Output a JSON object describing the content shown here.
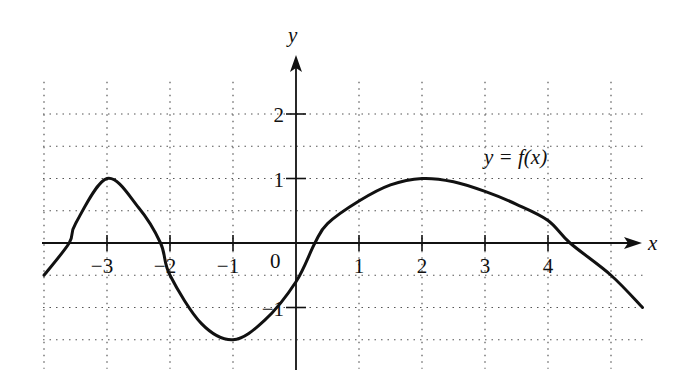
{
  "chart_data": {
    "type": "line",
    "title": "",
    "curve_label": "y = f(x)",
    "xlabel": "x",
    "ylabel": "y",
    "origin_label": "0",
    "xlim": [
      -4,
      5.5
    ],
    "ylim": [
      -2,
      3
    ],
    "grid": true,
    "grid_x_step": 1,
    "grid_y_step": 0.5,
    "x_ticks": [
      -3,
      -2,
      -1,
      1,
      2,
      3,
      4
    ],
    "x_tick_labels": [
      "−3",
      "−2",
      "−1",
      "1",
      "2",
      "3",
      "4"
    ],
    "y_ticks": [
      2,
      1,
      -1
    ],
    "y_tick_labels": [
      "2",
      "1",
      "−1"
    ],
    "series": [
      {
        "name": "f(x)",
        "x": [
          -4,
          -3.6,
          -3.5,
          -3,
          -2.5,
          -2.15,
          -2,
          -1.5,
          -1,
          -0.5,
          0,
          0.3,
          0.5,
          1,
          1.5,
          2,
          2.5,
          3,
          3.5,
          4,
          4.35,
          5,
          5.5
        ],
        "y": [
          -0.5,
          0,
          0.3,
          1,
          0.55,
          0,
          -0.5,
          -1.25,
          -1.5,
          -1.2,
          -0.6,
          0,
          0.3,
          0.65,
          0.9,
          1,
          0.95,
          0.8,
          0.6,
          0.35,
          0,
          -0.5,
          -1.0
        ]
      }
    ],
    "annotations": [
      {
        "text": "y = f(x)",
        "x": 3.2,
        "y": 1.3
      }
    ]
  }
}
